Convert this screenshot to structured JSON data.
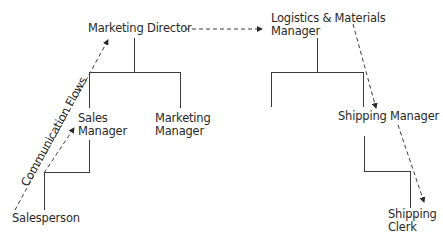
{
  "diagram": {
    "type": "organization communication flow",
    "nodes": {
      "marketing_director": "Marketing Director",
      "sales_manager_line1": "Sales",
      "sales_manager_line2": "Manager",
      "marketing_manager_line1": "Marketing",
      "marketing_manager_line2": "Manager",
      "salesperson": "Salesperson",
      "logistics_line1": "Logistics & Materials",
      "logistics_line2": "Manager",
      "shipping_manager": "Shipping Manager",
      "shipping_clerk_line1": "Shipping",
      "shipping_clerk_line2": "Clerk"
    },
    "annotation": "Communication Flows",
    "colors": {
      "line": "#3a3a3a",
      "text": "#2a2a2a",
      "background": "#ffffff"
    },
    "edges": [
      {
        "from": "Marketing Director",
        "to": "Sales Manager",
        "style": "solid"
      },
      {
        "from": "Marketing Director",
        "to": "Marketing Manager",
        "style": "solid"
      },
      {
        "from": "Sales Manager",
        "to": "Salesperson",
        "style": "solid"
      },
      {
        "from": "Logistics & Materials Manager",
        "to": "Shipping Manager",
        "style": "solid"
      },
      {
        "from": "Shipping Manager",
        "to": "Shipping Clerk",
        "style": "solid"
      },
      {
        "from": "Salesperson",
        "to": "Sales Manager",
        "style": "dashed-arrow"
      },
      {
        "from": "Salesperson",
        "to": "Marketing Director",
        "style": "dashed-arrow"
      },
      {
        "from": "Marketing Director",
        "to": "Logistics & Materials Manager",
        "style": "dashed-arrow"
      },
      {
        "from": "Logistics & Materials Manager",
        "to": "Shipping Manager",
        "style": "dashed-arrow"
      },
      {
        "from": "Shipping Manager",
        "to": "Shipping Clerk",
        "style": "dashed-arrow"
      }
    ]
  }
}
